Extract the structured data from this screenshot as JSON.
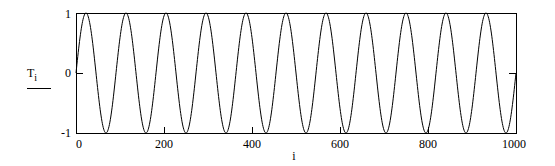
{
  "chart_data": {
    "type": "line",
    "title": "",
    "xlabel": "i",
    "ylabel": "T_i",
    "ylabel_main": "T",
    "ylabel_sub": "i",
    "xlim": [
      0,
      1000
    ],
    "ylim": [
      -1,
      1
    ],
    "x_ticks": [
      0,
      200,
      400,
      600,
      800,
      1000
    ],
    "x_tick_labels": [
      "0",
      "200",
      "400",
      "600",
      "800",
      "1000"
    ],
    "y_ticks": [
      -1,
      0,
      1
    ],
    "y_tick_labels": [
      "-1",
      "0",
      "1"
    ],
    "grid": false,
    "legend": null,
    "series": [
      {
        "name": "T_i",
        "function": "sin(2*pi*11*i/1000)",
        "cycles": 11,
        "x": [
          0,
          22.7,
          45.5,
          68.2,
          90.9,
          181.8,
          272.7,
          363.6,
          454.5,
          545.5,
          636.4,
          727.3,
          818.2,
          909.1,
          1000
        ],
        "values": [
          0,
          1,
          0,
          -1,
          0,
          0,
          0,
          0,
          0,
          0,
          0,
          0,
          0,
          0,
          0
        ]
      }
    ],
    "color": "#000000"
  },
  "frame": {
    "left": 76,
    "top": 13,
    "right": 516,
    "bottom": 133
  }
}
